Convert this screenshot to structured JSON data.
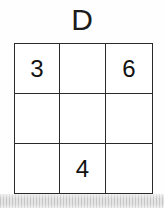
{
  "figure": {
    "title": "D",
    "type": "number-grid-puzzle",
    "background_color": "#fefefe",
    "line_color": "#2a2a2a",
    "text_color": "#121212"
  },
  "grid": {
    "rows": 3,
    "columns": 3,
    "cells": [
      [
        {
          "value": "3",
          "filled": true
        },
        {
          "value": "",
          "filled": false
        },
        {
          "value": "6",
          "filled": true
        }
      ],
      [
        {
          "value": "",
          "filled": false
        },
        {
          "value": "",
          "filled": false
        },
        {
          "value": "",
          "filled": false
        }
      ],
      [
        {
          "value": "",
          "filled": false
        },
        {
          "value": "4",
          "filled": true
        },
        {
          "value": "",
          "filled": false
        }
      ]
    ]
  },
  "scan_artifact": {
    "present": true,
    "description": "gray vertical-striped scanner band along bottom edge",
    "color": "#e4e4e4"
  }
}
